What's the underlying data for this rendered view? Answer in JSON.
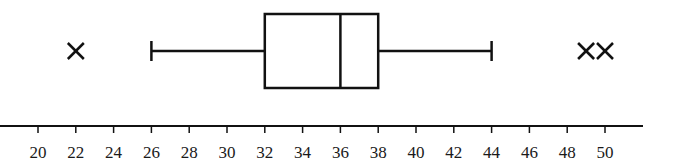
{
  "chart_data": {
    "type": "boxplot",
    "title": "",
    "xlabel": "",
    "ylabel": "",
    "orientation": "horizontal",
    "xlim": [
      18,
      52
    ],
    "ticks": [
      20,
      22,
      24,
      26,
      28,
      30,
      32,
      34,
      36,
      38,
      40,
      42,
      44,
      46,
      48,
      50
    ],
    "tick_labels": [
      "20",
      "22",
      "24",
      "26",
      "28",
      "30",
      "32",
      "34",
      "36",
      "38",
      "40",
      "42",
      "44",
      "46",
      "48",
      "50"
    ],
    "grid": false,
    "legend": null,
    "box": {
      "whisker_low": 26,
      "q1": 32,
      "median": 36,
      "q3": 38,
      "whisker_high": 44
    },
    "outliers": [
      22,
      49,
      50
    ],
    "outlier_marker": "x"
  },
  "colors": {
    "stroke": "#111111",
    "background": "#ffffff"
  }
}
